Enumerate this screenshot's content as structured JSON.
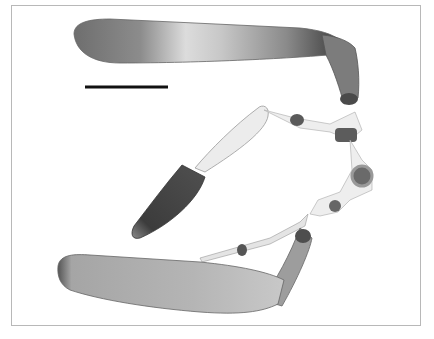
{
  "figure": {
    "frame_color": "#b8b8b8",
    "background": "#ffffff",
    "scale_bar": {
      "label": "",
      "color": "#111111",
      "x1": 85,
      "x2": 168,
      "y": 87
    },
    "segments": [
      {
        "name": "upper-blade-segment",
        "tone": "#7a7a7a"
      },
      {
        "name": "upper-elbow-segment",
        "tone": "#6a6a6a"
      },
      {
        "name": "translucent-joint-segments",
        "tone": "#d8d8d8"
      },
      {
        "name": "dark-distal-segment",
        "tone": "#3a3a3a"
      },
      {
        "name": "lower-blade-segment",
        "tone": "#9a9a9a"
      },
      {
        "name": "lower-elbow-segment",
        "tone": "#8a8a8a"
      }
    ]
  }
}
